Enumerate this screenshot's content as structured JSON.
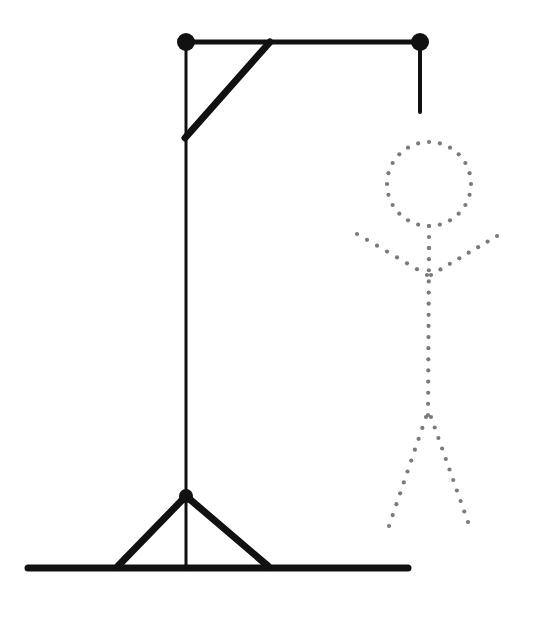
{
  "canvas": {
    "width": 533,
    "height": 620,
    "background": "#ffffff"
  },
  "puzzle": {
    "title": "Hangman",
    "stroke_color": "#111111",
    "figure_color": "#7a7a7a",
    "node_color": "#111111"
  },
  "gallows": {
    "name": "gallows",
    "stroke": "#111111",
    "beam_width": 5,
    "post_width": 3,
    "brace_width": 7,
    "ground_width": 7,
    "node_radius": 8,
    "parts": [
      {
        "id": "ground-line",
        "label": "Ground",
        "x1": 28,
        "y1": 568,
        "x2": 408,
        "y2": 568,
        "width": 7
      },
      {
        "id": "vertical-post",
        "label": "Vertical post",
        "x1": 186,
        "y1": 42,
        "x2": 186,
        "y2": 568,
        "width": 3
      },
      {
        "id": "top-beam",
        "label": "Top beam",
        "x1": 186,
        "y1": 42,
        "x2": 420,
        "y2": 42,
        "width": 5
      },
      {
        "id": "rope",
        "label": "Rope",
        "x1": 420,
        "y1": 42,
        "x2": 420,
        "y2": 112,
        "width": 4
      },
      {
        "id": "corner-brace",
        "label": "Corner brace",
        "x1": 185,
        "y1": 138,
        "x2": 270,
        "y2": 42,
        "width": 7
      },
      {
        "id": "base-brace-left",
        "label": "Left base brace",
        "x1": 186,
        "y1": 496,
        "x2": 118,
        "y2": 566,
        "width": 7
      },
      {
        "id": "base-brace-right",
        "label": "Right base brace",
        "x1": 186,
        "y1": 496,
        "x2": 268,
        "y2": 566,
        "width": 7
      }
    ],
    "nodes": [
      {
        "id": "node-top-left",
        "label": "Top left joint",
        "cx": 186,
        "cy": 42,
        "r": 9
      },
      {
        "id": "node-top-right",
        "label": "Top right joint",
        "cx": 420,
        "cy": 42,
        "r": 9
      },
      {
        "id": "node-base",
        "label": "Base joint",
        "cx": 186,
        "cy": 496,
        "r": 7
      }
    ]
  },
  "figure": {
    "name": "stick-figure",
    "color": "#7a7a7a",
    "dot_radius": 2.1,
    "dot_spacing": 11,
    "head": {
      "id": "head",
      "label": "Head",
      "cx": 429,
      "cy": 184,
      "r": 42,
      "dots": 24
    },
    "limbs": [
      {
        "id": "neck",
        "label": "Neck",
        "x1": 429,
        "y1": 226,
        "x2": 429,
        "y2": 248
      },
      {
        "id": "torso",
        "label": "Torso",
        "x1": 429,
        "y1": 248,
        "x2": 428,
        "y2": 415
      },
      {
        "id": "arm-left",
        "label": "Left arm",
        "x1": 427,
        "y1": 275,
        "x2": 357,
        "y2": 234
      },
      {
        "id": "arm-right",
        "label": "Right arm",
        "x1": 431,
        "y1": 275,
        "x2": 497,
        "y2": 236
      },
      {
        "id": "leg-left",
        "label": "Left leg",
        "x1": 426,
        "y1": 417,
        "x2": 389,
        "y2": 526
      },
      {
        "id": "leg-right",
        "label": "Right leg",
        "x1": 431,
        "y1": 417,
        "x2": 468,
        "y2": 522
      }
    ]
  }
}
